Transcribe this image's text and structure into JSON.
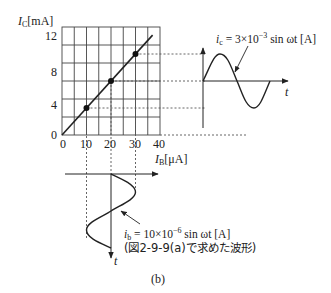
{
  "figure": {
    "caption": "(b)",
    "transfer_chart": {
      "y_axis_label": {
        "symbol": "I",
        "subscript": "C",
        "unit": "[mA]"
      },
      "x_axis_label": {
        "symbol": "I",
        "subscript": "B",
        "unit": "[μA]"
      },
      "y_ticks": [
        "12",
        "8",
        "4",
        "0"
      ],
      "x_ticks": [
        "0",
        "10",
        "20",
        "30",
        "40"
      ],
      "x_range": [
        0,
        40
      ],
      "y_range": [
        0,
        12
      ],
      "grid": {
        "x_step": 5,
        "y_step": 2
      },
      "line": {
        "from": [
          0,
          0
        ],
        "to": [
          37,
          11.1
        ]
      },
      "points": [
        {
          "ib_uA": 10,
          "ic_mA": 3
        },
        {
          "ib_uA": 20,
          "ic_mA": 6
        },
        {
          "ib_uA": 30,
          "ic_mA": 9
        }
      ]
    },
    "output_wave": {
      "equation_lhs_symbol": "i",
      "equation_lhs_sub": "c",
      "equation_rhs_prefix": " = 3×10",
      "equation_exponent": "−3",
      "equation_rhs_suffix": " sin ωt [A]",
      "time_axis_label": "t"
    },
    "input_wave": {
      "equation_lhs_symbol": "i",
      "equation_lhs_sub": "b",
      "equation_rhs_prefix": " = 10×10",
      "equation_exponent": "−6",
      "equation_rhs_suffix": " sin ωt [A]",
      "note": "(図2-9-9(a)で求めた波形)",
      "time_axis_label": "t"
    }
  }
}
